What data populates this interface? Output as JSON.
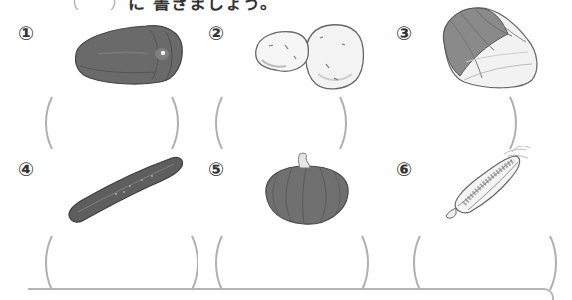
{
  "instructions": {
    "paren_open": "（",
    "paren_close": "）",
    "text": "に 書きましょう。"
  },
  "items": [
    {
      "number": "①",
      "vegetable_icon": "green-pepper-icon",
      "answer": ""
    },
    {
      "number": "②",
      "vegetable_icon": "potato-icon",
      "answer": ""
    },
    {
      "number": "③",
      "vegetable_icon": "chinese-cabbage-icon",
      "answer": ""
    },
    {
      "number": "④",
      "vegetable_icon": "cucumber-icon",
      "answer": ""
    },
    {
      "number": "⑤",
      "vegetable_icon": "pumpkin-icon",
      "answer": ""
    },
    {
      "number": "⑥",
      "vegetable_icon": "corn-icon",
      "answer": ""
    }
  ],
  "colors": {
    "text": "#333333",
    "bracket": "#b0b0b0",
    "vegetable_dark": "#5a5a5a",
    "vegetable_light": "#efefef"
  }
}
